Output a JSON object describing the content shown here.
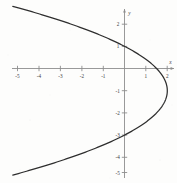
{
  "figure": {
    "background_color": "#fdfdfc",
    "axis_color": "#8d8d8d",
    "curve_color": "#2e2e2e",
    "label_color": "#3c3c3c"
  },
  "axes": {
    "x_axis_name": "x",
    "y_axis_name": "y",
    "x_ticks": [
      {
        "value": -5,
        "label": "-5"
      },
      {
        "value": -4,
        "label": "-4"
      },
      {
        "value": -3,
        "label": "-3"
      },
      {
        "value": -2,
        "label": "-2"
      },
      {
        "value": -1,
        "label": "-1"
      },
      {
        "value": 1,
        "label": "1"
      },
      {
        "value": 2,
        "label": "2"
      }
    ],
    "y_ticks": [
      {
        "value": 2,
        "label": "2"
      },
      {
        "value": 1,
        "label": "1"
      },
      {
        "value": -1,
        "label": "-1"
      },
      {
        "value": -2,
        "label": "-2"
      },
      {
        "value": -3,
        "label": "-3"
      },
      {
        "value": -4,
        "label": "-4"
      },
      {
        "value": -5,
        "label": "-5"
      }
    ]
  },
  "chart_data": {
    "type": "line",
    "title": "",
    "xlabel": "x",
    "ylabel": "y",
    "xlim": [
      -5.3,
      2.5
    ],
    "ylim": [
      -5.6,
      2.7
    ],
    "grid": false,
    "legend": null,
    "orientation": "horizontal-parabola-opening-left",
    "vertex": {
      "x": 2,
      "y": -1
    },
    "equation": "x = 2 - 0.5 (y + 1)^2",
    "x_intercepts": [
      0
    ],
    "y_intercepts": [
      1,
      -3
    ],
    "series": [
      {
        "name": "x = 2 - 0.5 (y + 1)^2",
        "x": [
          -5.12,
          -4.62,
          -4.12,
          -3.62,
          -3.12,
          -2.62,
          -2.12,
          -1.62,
          -1.12,
          -0.62,
          -0.12,
          0.38,
          0.88,
          1.38,
          1.63,
          1.88,
          2.0,
          1.88,
          1.63,
          1.38,
          0.88,
          0.38,
          -0.12,
          -0.62,
          -1.12,
          -1.62,
          -2.12,
          -2.62,
          -3.12,
          -3.62,
          -4.12,
          -4.62,
          -5.12
        ],
        "y": [
          2.77,
          2.63,
          2.49,
          2.33,
          2.17,
          2.0,
          1.81,
          1.6,
          1.36,
          1.09,
          0.76,
          0.36,
          -0.17,
          -0.89,
          -1.0,
          -1.48,
          -1.0,
          -0.52,
          -1.0,
          -1.11,
          -2.17,
          -2.36,
          -2.76,
          -3.09,
          -3.36,
          -3.6,
          -3.81,
          -4.0,
          -4.17,
          -4.33,
          -4.49,
          -4.63,
          -4.77
        ]
      }
    ],
    "curve_endpoints": {
      "upper_left": {
        "x": -5.15,
        "y": 2.8
      },
      "lower_left": {
        "x": -5.15,
        "y": -4.8
      }
    }
  }
}
